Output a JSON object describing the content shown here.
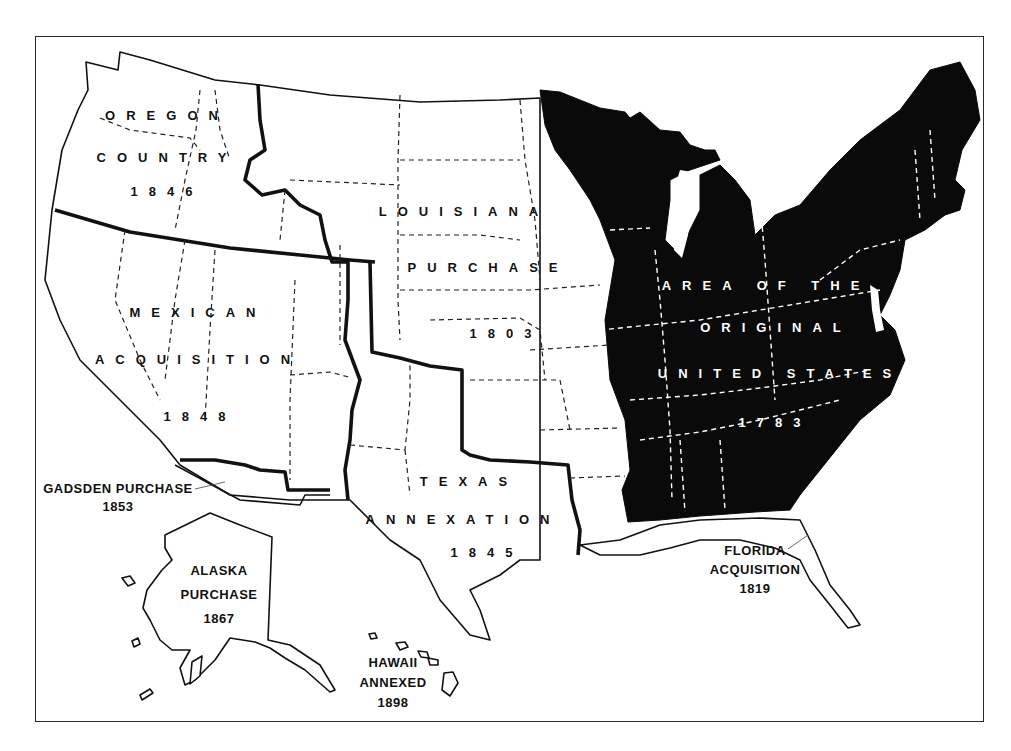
{
  "map": {
    "subject": "Territorial growth of the United States",
    "colors": {
      "original_states_fill": "#0a0a0a",
      "acquisition_fill": "#ffffff",
      "border": "#111111",
      "frame": "#2a2a2a"
    },
    "regions": [
      {
        "id": "original",
        "lines": [
          "AREA OF THE",
          "ORIGINAL",
          "UNITED STATES",
          "1783"
        ],
        "style": "inverted"
      },
      {
        "id": "louisiana",
        "lines": [
          "LOUISIANA",
          "PURCHASE",
          "1803"
        ]
      },
      {
        "id": "oregon",
        "lines": [
          "OREGON",
          "COUNTRY",
          "1846"
        ]
      },
      {
        "id": "mexican",
        "lines": [
          "MEXICAN",
          "ACQUISITION",
          "1848"
        ]
      },
      {
        "id": "texas",
        "lines": [
          "TEXAS",
          "ANNEXATION",
          "1845"
        ]
      },
      {
        "id": "gadsden",
        "lines": [
          "GADSDEN PURCHASE",
          "1853"
        ],
        "callout": true
      },
      {
        "id": "florida",
        "lines": [
          "FLORIDA",
          "ACQUISITION",
          "1819"
        ],
        "callout": true
      },
      {
        "id": "alaska",
        "lines": [
          "ALASKA",
          "PURCHASE",
          "1867"
        ]
      },
      {
        "id": "hawaii",
        "lines": [
          "HAWAII",
          "ANNEXED",
          "1898"
        ]
      }
    ]
  }
}
